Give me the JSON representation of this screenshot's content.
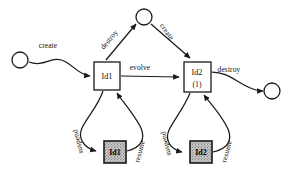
{
  "diagram": {
    "type": "object-lifecycle-state-diagram",
    "canvas": {
      "width": 290,
      "height": 182,
      "background": "#ffffff"
    },
    "colors": {
      "stroke": "#1a1a1a",
      "text": "#111111",
      "node_fill": "#ffffff",
      "shaded_fill": "#b8b8b8"
    },
    "nodes": [
      {
        "id": "start-circle",
        "kind": "circle",
        "label": "",
        "cx": 20,
        "cy": 60,
        "r": 8
      },
      {
        "id": "top-circle",
        "kind": "circle",
        "label": "",
        "cx": 144,
        "cy": 17,
        "r": 8
      },
      {
        "id": "end-circle",
        "kind": "circle",
        "label": "",
        "cx": 272,
        "cy": 91,
        "r": 8
      },
      {
        "id": "state-id1",
        "kind": "box",
        "label": "Id1",
        "sublabel": "",
        "x": 94,
        "y": 62,
        "w": 26,
        "h": 28
      },
      {
        "id": "state-id2",
        "kind": "box",
        "label": "Id2",
        "sublabel": "(1)",
        "x": 184,
        "y": 62,
        "w": 27,
        "h": 30
      },
      {
        "id": "suspended-id1",
        "kind": "box-shaded",
        "label": "Id1",
        "sublabel": "",
        "x": 104,
        "y": 141,
        "w": 22,
        "h": 22
      },
      {
        "id": "suspended-id2",
        "kind": "box-shaded",
        "label": "Id2",
        "sublabel": "",
        "x": 190,
        "y": 141,
        "w": 22,
        "h": 22
      }
    ],
    "edges": [
      {
        "id": "edge-create-start",
        "label": "create",
        "from": "start-circle",
        "to": "state-id1",
        "label_x": 48,
        "label_y": 48,
        "rotate": 0
      },
      {
        "id": "edge-destroy-top",
        "label": "destroy",
        "from": "state-id1",
        "to": "top-circle",
        "label_x": 111,
        "label_y": 40,
        "rotate": -52
      },
      {
        "id": "edge-create-top",
        "label": "create",
        "from": "top-circle",
        "to": "state-id2",
        "label_x": 163,
        "label_y": 34,
        "rotate": 55
      },
      {
        "id": "edge-evolve",
        "label": "evolve",
        "from": "state-id1",
        "to": "state-id2",
        "label_x": 137,
        "label_y": 70,
        "rotate": 0
      },
      {
        "id": "edge-destroy-end",
        "label": "destroy",
        "from": "state-id2",
        "to": "end-circle",
        "label_x": 228,
        "label_y": 72,
        "rotate": 0
      },
      {
        "id": "edge-suspend-1",
        "label": "suspend",
        "from": "state-id1",
        "to": "suspended-id1",
        "label_x": 81,
        "label_y": 141,
        "rotate": -105
      },
      {
        "id": "edge-resume-1",
        "label": "resume",
        "from": "suspended-id1",
        "to": "state-id1",
        "label_x": 141,
        "label_y": 153,
        "rotate": -76
      },
      {
        "id": "edge-suspend-2",
        "label": "suspend",
        "from": "state-id2",
        "to": "suspended-id2",
        "label_x": 170,
        "label_y": 143,
        "rotate": -105
      },
      {
        "id": "edge-resume-2",
        "label": "resume",
        "from": "suspended-id2",
        "to": "state-id2",
        "label_x": 228,
        "label_y": 153,
        "rotate": -76
      }
    ]
  }
}
